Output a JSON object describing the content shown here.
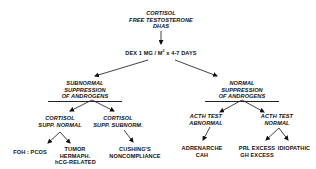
{
  "diagram": {
    "root": {
      "lines": [
        "CORTISOL",
        "FREE TESTOSTERONE",
        "DHAS"
      ]
    },
    "test": {
      "prefix": "DEX 1 MG / M",
      "sup": "2",
      "suffix": " x 4-7 DAYS"
    },
    "left_branch": {
      "lines": [
        "SUBNORMAL",
        "SUPPRESSION",
        "OF ANDROGENS"
      ]
    },
    "right_branch": {
      "lines": [
        "NORMAL",
        "SUPPRESSION",
        "OF ANDROGENS"
      ]
    },
    "left_left": {
      "lines": [
        "CORTISOL",
        "SUPP. NORMAL"
      ]
    },
    "left_right": {
      "lines": [
        "CORTISOL",
        "SUPP. SUBNORM."
      ]
    },
    "right_left": {
      "lines": [
        "ACTH TEST",
        "ABNORMAL"
      ]
    },
    "right_right": {
      "lines": [
        "ACTH TEST",
        "NORMAL"
      ]
    },
    "leaves": {
      "foh_pcos": {
        "lines": [
          "FOH : PCOS"
        ]
      },
      "tumor": {
        "lines": [
          "TUMOR",
          "HERMAPH.",
          "hCG-RELATED"
        ]
      },
      "cushings": {
        "lines": [
          "CUSHING'S",
          "NONCOMPLIANCE"
        ]
      },
      "adrenarche": {
        "lines": [
          "ADRENARCHE",
          "CAH"
        ]
      },
      "prl_gh": {
        "lines": [
          "PRL EXCESS",
          "GH EXCESS"
        ]
      },
      "idiopathic": {
        "lines": [
          "IDIOPATHIC"
        ]
      }
    }
  }
}
